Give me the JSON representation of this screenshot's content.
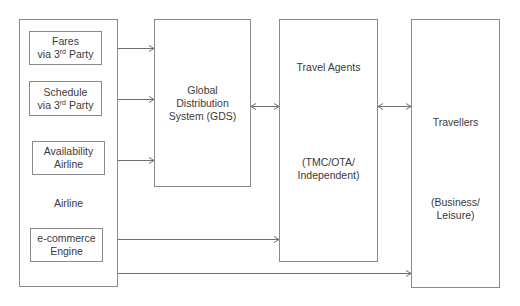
{
  "diagram": {
    "nodes": {
      "airline": {
        "label": "Airline"
      },
      "fares": {
        "line1": "Fares",
        "line2_pre": "via 3",
        "line2_sup": "rd",
        "line2_post": " Party"
      },
      "schedule": {
        "line1": "Schedule",
        "line2_pre": "via 3",
        "line2_sup": "rd",
        "line2_post": " Party"
      },
      "availability": {
        "line1": "Availability",
        "line2": "Airline"
      },
      "ecommerce": {
        "line1": "e-commerce",
        "line2": "Engine"
      },
      "gds": {
        "line1": "Global",
        "line2": "Distribution",
        "line3": "System (GDS)"
      },
      "travel_agents": {
        "title": "Travel Agents",
        "sub1": "(TMC/OTA/",
        "sub2": "Independent)"
      },
      "travellers": {
        "title": "Travellers",
        "sub1": "(Business/",
        "sub2": "Leisure)"
      }
    },
    "edges": [
      {
        "from": "fares",
        "to": "gds",
        "type": "directed"
      },
      {
        "from": "schedule",
        "to": "gds",
        "type": "directed"
      },
      {
        "from": "availability",
        "to": "gds",
        "type": "directed"
      },
      {
        "from": "gds",
        "to": "travel_agents",
        "type": "bidirectional"
      },
      {
        "from": "travel_agents",
        "to": "travellers",
        "type": "bidirectional"
      },
      {
        "from": "ecommerce",
        "to": "travel_agents",
        "type": "directed"
      },
      {
        "from": "airline",
        "to": "travellers",
        "type": "directed"
      }
    ],
    "colors": {
      "stroke": "#8a8a8a",
      "text": "#3a3a3a",
      "background": "#ffffff"
    }
  }
}
